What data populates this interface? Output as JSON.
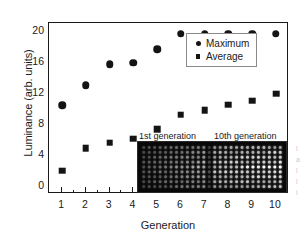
{
  "chart_data": {
    "type": "scatter",
    "title": "",
    "xlabel": "Generation",
    "ylabel": "Luminance (arb. units)",
    "categories": [
      1,
      2,
      3,
      4,
      5,
      6,
      7,
      8,
      9,
      10
    ],
    "x": [
      1,
      2,
      3,
      4,
      5,
      6,
      7,
      8,
      9,
      10
    ],
    "xlim": [
      0.45,
      10.55
    ],
    "ylim": [
      -1.0,
      21.0
    ],
    "yticks": [
      0,
      4,
      8,
      12,
      16,
      20
    ],
    "ytick_labels": [
      "0",
      "4",
      "8",
      "12",
      "16",
      "20"
    ],
    "xticks": [
      1,
      2,
      3,
      4,
      5,
      6,
      7,
      8,
      9,
      10
    ],
    "xtick_labels": [
      "1",
      "2",
      "3",
      "4",
      "5",
      "6",
      "7",
      "8",
      "9",
      "10"
    ],
    "yminor_step": 2,
    "xminor_step": 0.5,
    "grid": false,
    "legend_position": "upper right",
    "series": [
      {
        "name": "Maximum",
        "marker": "circle",
        "color": "#141414",
        "values": [
          10.4,
          13.0,
          15.7,
          15.9,
          17.6,
          19.6,
          19.6,
          19.6,
          19.6,
          19.6
        ]
      },
      {
        "name": "Average",
        "marker": "square",
        "color": "#141414",
        "values": [
          2.0,
          4.9,
          5.6,
          6.1,
          7.3,
          9.2,
          9.8,
          10.5,
          11.0,
          11.9
        ]
      }
    ],
    "annotations": [
      {
        "text": "1st generation",
        "kind": "inset-caption"
      },
      {
        "text": "10th generation",
        "kind": "inset-caption"
      }
    ],
    "inset": {
      "description": "photograph of an emissive pixel array, dim on the left half and bright on the right half",
      "background_color": "#080808",
      "dot_color": "#f0f0f0",
      "columns": 26,
      "rows": 9
    }
  },
  "legend": {
    "items": [
      {
        "label": "Maximum",
        "marker": "circle"
      },
      {
        "label": "Average",
        "marker": "square"
      }
    ]
  },
  "inset_captions": {
    "first": "1st generation",
    "tenth": "10th generation"
  },
  "edge_text": {
    "lines": [
      "l",
      "a",
      "l",
      "l",
      "i"
    ]
  }
}
